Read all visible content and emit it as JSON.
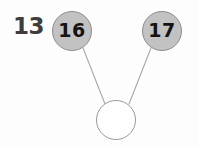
{
  "worksheet": {
    "problem_number": "13",
    "diagram_type": "number-bond",
    "background_color": "#fdfdfd"
  },
  "nodes": {
    "part_left": {
      "name": "part-left",
      "value": "16",
      "filled": true,
      "fill_color": "#c2c2c2",
      "stroke_color": "#8c8c8c",
      "text_color": "#141414",
      "cx": 72,
      "cy": 31,
      "r": 20
    },
    "part_right": {
      "name": "part-right",
      "value": "17",
      "filled": true,
      "fill_color": "#c2c2c2",
      "stroke_color": "#8c8c8c",
      "text_color": "#141414",
      "cx": 162,
      "cy": 31,
      "r": 20
    },
    "whole": {
      "name": "whole-answer",
      "value": "",
      "filled": false,
      "fill_color": "#ffffff",
      "stroke_color": "#9a9a9a",
      "text_color": "#141414",
      "cx": 116,
      "cy": 120,
      "r": 20
    }
  },
  "connectors": [
    {
      "name": "connector-left",
      "from": "part_left",
      "to": "whole",
      "x1": 83,
      "y1": 48,
      "x2": 105,
      "y2": 104,
      "color": "#a8a8a8",
      "width": 1
    },
    {
      "name": "connector-right",
      "from": "part_right",
      "to": "whole",
      "x1": 151,
      "y1": 48,
      "x2": 129,
      "y2": 104,
      "color": "#a8a8a8",
      "width": 1
    }
  ],
  "chart_data": {
    "type": "diagram",
    "title": "",
    "diagram": "number-bond",
    "problem_number": "13",
    "parts": [
      16,
      17
    ],
    "whole": null,
    "whole_label": "",
    "node_labels": [
      "16",
      "17",
      ""
    ],
    "edges": [
      [
        "16",
        "whole"
      ],
      [
        "17",
        "whole"
      ]
    ]
  }
}
